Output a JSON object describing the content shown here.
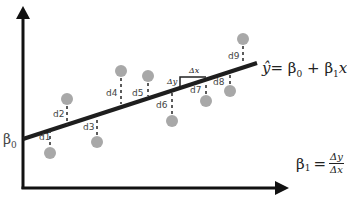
{
  "diagram": {
    "type": "linear-regression-illustration",
    "axes": {
      "x_arrow": true,
      "y_arrow": true
    },
    "intercept_label": "β",
    "intercept_sub": "0",
    "equation": {
      "lhs": "ŷ",
      "eq": "=",
      "b0": "β",
      "b0_sub": "0",
      "plus": "+",
      "b1": "β",
      "b1_sub": "1",
      "var": "x"
    },
    "slope_formula": {
      "lhs": "β",
      "lhs_sub": "1",
      "eq": "=",
      "numerator": "Δy",
      "denominator": "Δx"
    },
    "slope_triangle": {
      "dx_label": "Δx",
      "dy_label": "Δy"
    },
    "residuals": [
      {
        "label": "d1",
        "point": [
          50,
          153
        ],
        "line_y": 131
      },
      {
        "label": "d2",
        "point": [
          67,
          99
        ],
        "line_y": 125
      },
      {
        "label": "d3",
        "point": [
          97,
          142
        ],
        "line_y": 115
      },
      {
        "label": "d4",
        "point": [
          121,
          71
        ],
        "line_y": 107
      },
      {
        "label": "d5",
        "point": [
          148,
          76
        ],
        "line_y": 98
      },
      {
        "label": "d6",
        "point": [
          172,
          121
        ],
        "line_y": 90
      },
      {
        "label": "d7",
        "point": [
          206,
          101
        ],
        "line_y": 79
      },
      {
        "label": "d8",
        "point": [
          230,
          91
        ],
        "line_y": 71
      },
      {
        "label": "d9",
        "point": [
          243,
          39
        ],
        "line_y": 67
      }
    ],
    "colors": {
      "axis": "#111111",
      "line": "#1e1e1e",
      "point": "#a8a8a8",
      "text": "#333333"
    }
  }
}
